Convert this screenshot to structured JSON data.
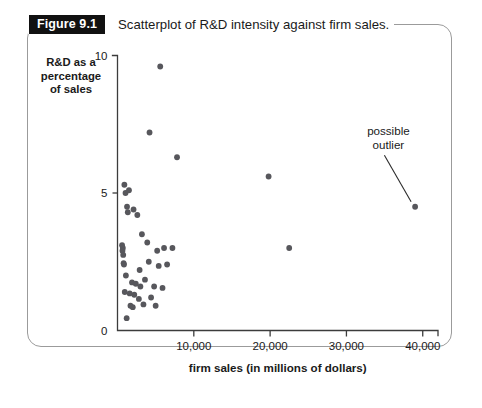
{
  "figure": {
    "badge_label": "Figure 9.1",
    "caption": "Scatterplot of R&D intensity against firm sales."
  },
  "chart_data": {
    "type": "scatter",
    "title": "Scatterplot of R&D intensity against firm sales.",
    "xlabel": "firm sales (in millions of dollars)",
    "ylabel": "R&D as a percentage of sales",
    "ylabel_lines": [
      "R&D as a",
      "percentage",
      "of sales"
    ],
    "xlim": [
      0,
      42000
    ],
    "ylim": [
      0,
      10
    ],
    "xticks": [
      10000,
      20000,
      30000,
      40000
    ],
    "xtick_labels": [
      "10,000",
      "20,000",
      "30,000",
      "40,000"
    ],
    "yticks": [
      0,
      5,
      10
    ],
    "ytick_labels": [
      "0",
      "5",
      "10"
    ],
    "grid": false,
    "legend": null,
    "point_color": "#57575c",
    "axis_color": "#3c3c3c",
    "annotations": [
      {
        "text_lines": [
          "possible",
          "outlier"
        ],
        "text_x": 35500,
        "text_y": 7.1,
        "points_to_x": 39000,
        "points_to_y": 4.5
      }
    ],
    "x": [
      5600,
      4200,
      7800,
      900,
      1050,
      1500,
      1250,
      2100,
      1350,
      2600,
      19800,
      22500,
      600,
      700,
      650,
      750,
      3200,
      3900,
      5200,
      6100,
      7200,
      800,
      850,
      2900,
      4100,
      5400,
      6500,
      1100,
      1900,
      2400,
      3000,
      3600,
      4800,
      5900,
      950,
      1600,
      2200,
      2800,
      4400,
      1700,
      2000,
      3400,
      5000,
      1200,
      39000
    ],
    "y": [
      9.6,
      7.2,
      6.3,
      5.3,
      5.0,
      5.1,
      4.5,
      4.4,
      4.3,
      4.2,
      5.6,
      3.0,
      3.1,
      3.0,
      2.9,
      2.75,
      3.5,
      3.2,
      2.9,
      3.0,
      3.0,
      2.45,
      2.4,
      2.2,
      2.5,
      2.35,
      2.4,
      2.0,
      1.75,
      1.7,
      1.6,
      1.85,
      1.6,
      1.55,
      1.4,
      1.35,
      1.3,
      1.15,
      1.2,
      0.9,
      0.85,
      0.95,
      0.9,
      0.45,
      4.5
    ],
    "points": [
      {
        "x": 5600,
        "y": 9.6
      },
      {
        "x": 4200,
        "y": 7.2
      },
      {
        "x": 7800,
        "y": 6.3
      },
      {
        "x": 900,
        "y": 5.3
      },
      {
        "x": 1050,
        "y": 5.0
      },
      {
        "x": 1500,
        "y": 5.1
      },
      {
        "x": 1250,
        "y": 4.5
      },
      {
        "x": 2100,
        "y": 4.4
      },
      {
        "x": 1350,
        "y": 4.3
      },
      {
        "x": 2600,
        "y": 4.2
      },
      {
        "x": 19800,
        "y": 5.6
      },
      {
        "x": 22500,
        "y": 3.0
      },
      {
        "x": 600,
        "y": 3.1
      },
      {
        "x": 700,
        "y": 3.0
      },
      {
        "x": 650,
        "y": 2.9
      },
      {
        "x": 750,
        "y": 2.75
      },
      {
        "x": 3200,
        "y": 3.5
      },
      {
        "x": 3900,
        "y": 3.2
      },
      {
        "x": 5200,
        "y": 2.9
      },
      {
        "x": 6100,
        "y": 3.0
      },
      {
        "x": 7200,
        "y": 3.0
      },
      {
        "x": 800,
        "y": 2.45
      },
      {
        "x": 850,
        "y": 2.4
      },
      {
        "x": 2900,
        "y": 2.2
      },
      {
        "x": 4100,
        "y": 2.5
      },
      {
        "x": 5400,
        "y": 2.35
      },
      {
        "x": 6500,
        "y": 2.4
      },
      {
        "x": 1100,
        "y": 2.0
      },
      {
        "x": 1900,
        "y": 1.75
      },
      {
        "x": 2400,
        "y": 1.7
      },
      {
        "x": 3000,
        "y": 1.6
      },
      {
        "x": 3600,
        "y": 1.85
      },
      {
        "x": 4800,
        "y": 1.6
      },
      {
        "x": 5900,
        "y": 1.55
      },
      {
        "x": 950,
        "y": 1.4
      },
      {
        "x": 1600,
        "y": 1.35
      },
      {
        "x": 2200,
        "y": 1.3
      },
      {
        "x": 2800,
        "y": 1.15
      },
      {
        "x": 4400,
        "y": 1.2
      },
      {
        "x": 1700,
        "y": 0.9
      },
      {
        "x": 2000,
        "y": 0.85
      },
      {
        "x": 3400,
        "y": 0.95
      },
      {
        "x": 5000,
        "y": 0.9
      },
      {
        "x": 1200,
        "y": 0.45
      },
      {
        "x": 39000,
        "y": 4.5
      }
    ]
  }
}
